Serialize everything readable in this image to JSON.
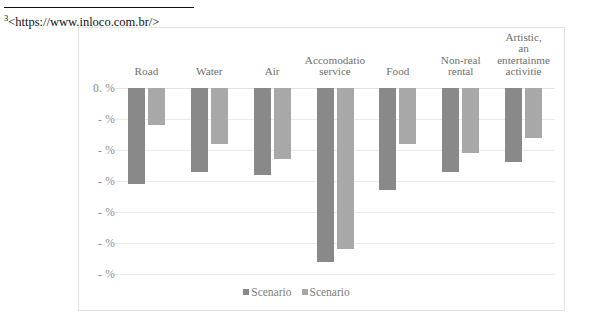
{
  "footnote": {
    "marker": "3",
    "text": "<https://www.inloco.com.br/>"
  },
  "chart_data": {
    "type": "bar",
    "title": "",
    "xlabel": "",
    "ylabel": "",
    "orientation": "vertical",
    "grid": true,
    "legend_position": "bottom",
    "ylim": [
      -60,
      0
    ],
    "y_tick_labels": [
      "0. %",
      "- %",
      "- %",
      "- %",
      "- %",
      "- %",
      "- %"
    ],
    "y_tick_values": [
      0,
      -10,
      -20,
      -30,
      -40,
      -50,
      -60
    ],
    "note_on_labels": "Numeric digits of the axis tick labels are clipped in the source image; only '0. %' and '- %' are rendered.",
    "categories": [
      "Road",
      "Water",
      "Air",
      "Accomodatio service",
      "Food",
      "Non-real rental",
      "Artistic, an entertainme activitie"
    ],
    "category_label_lines": [
      [
        "Road"
      ],
      [
        "Water"
      ],
      [
        "Air"
      ],
      [
        "Accomodatio",
        "service"
      ],
      [
        "Food"
      ],
      [
        "Non-real",
        "rental"
      ],
      [
        "Artistic,",
        "an",
        "entertainme",
        "activitie"
      ]
    ],
    "series": [
      {
        "name": "Scenario",
        "color": "#898989",
        "values": [
          -31,
          -27,
          -28,
          -56,
          -33,
          -27,
          -24
        ]
      },
      {
        "name": "Scenario",
        "color": "#a8a8a8",
        "values": [
          -12,
          -18,
          -23,
          -52,
          -18,
          -21,
          -16
        ]
      }
    ],
    "legend": [
      "Scenario",
      "Scenario"
    ]
  },
  "colors": {
    "series_1": "#898989",
    "series_2": "#a8a8a8",
    "gridline": "#eceaea",
    "frame_border": "#e2e2e2",
    "axis_text": "#8c8c8c",
    "category_text": "#6f6f6f",
    "footnote_text": "#111111"
  }
}
